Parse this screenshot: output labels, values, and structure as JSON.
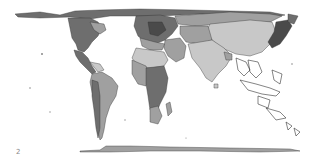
{
  "map": {
    "type": "cartogram",
    "description": "Grayscale world cartogram with countries resized by value; Asia (India/China) enlarged, Americas narrow, Europe dense in dark grays",
    "colors": {
      "background": "#ffffff",
      "light": "#c8c8c8",
      "medium": "#a0a0a0",
      "dark": "#6e6e6e",
      "darkest": "#4a4a4a",
      "outline": "#333333"
    },
    "regions": [
      {
        "name": "north-america",
        "shade": "dark"
      },
      {
        "name": "central-america",
        "shade": "medium"
      },
      {
        "name": "south-america",
        "shade": "medium"
      },
      {
        "name": "europe",
        "shade": "dark"
      },
      {
        "name": "africa",
        "shade": "medium"
      },
      {
        "name": "asia-main",
        "shade": "light"
      },
      {
        "name": "east-asia-coast",
        "shade": "darkest"
      },
      {
        "name": "southeast-asia-islands",
        "shade": "outline"
      },
      {
        "name": "antarctica",
        "shade": "outline"
      }
    ]
  },
  "footer": {
    "label": "2"
  }
}
